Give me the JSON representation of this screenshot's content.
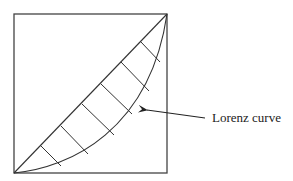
{
  "diagram": {
    "type": "lorenz-curve-illustration",
    "annotation_label": "Lorenz curve",
    "colors": {
      "stroke": "#333333",
      "background": "#ffffff",
      "text": "#222222"
    },
    "elements": [
      "square-frame",
      "line-of-equality-diagonal",
      "lorenz-curve",
      "hatched-area",
      "arrow"
    ]
  }
}
